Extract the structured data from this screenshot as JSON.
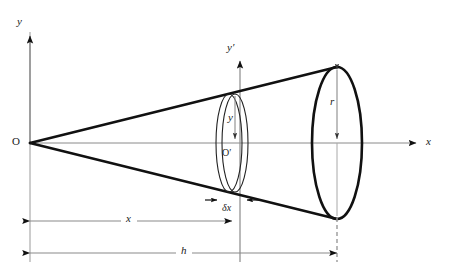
{
  "figure": {
    "background_color": "#ffffff",
    "stroke_color": "#111111",
    "axis_color": "#808080",
    "thin_color": "#222222",
    "dash_color": "#9a9a9a",
    "width": 454,
    "height": 277
  },
  "labels": {
    "y_axis": "y",
    "y_prime_axis": "y′",
    "x_axis": "x",
    "origin": "O",
    "origin_prime": "O′",
    "radius_small": "y",
    "radius_large": "r",
    "thickness": "δx",
    "distance_x": "x",
    "height_h": "h"
  },
  "geometry": {
    "origin": {
      "x": 30,
      "y": 143
    },
    "x_axis_end": {
      "x": 420,
      "y": 143
    },
    "y_axis_top": {
      "x": 30,
      "y": 32
    },
    "y_prime_axis": {
      "x": 240,
      "top": 57,
      "bottom": 262
    },
    "small_ellipse_front": {
      "cx": 235,
      "cy": 143,
      "rx": 13,
      "ry": 49
    },
    "small_ellipse_back": {
      "cx": 229,
      "cy": 143,
      "rx": 13,
      "ry": 49
    },
    "large_ellipse": {
      "cx": 337,
      "cy": 143,
      "rx": 25,
      "ry": 76
    },
    "cone_upper_line": {
      "x1": 30,
      "y1": 143,
      "x2": 337,
      "y2": 67
    },
    "cone_lower_line": {
      "x1": 30,
      "y1": 143,
      "x2": 337,
      "y2": 219
    },
    "dimension_x": {
      "y": 221,
      "x1": 30,
      "x2": 232
    },
    "dimension_h": {
      "y": 253,
      "x1": 30,
      "x2": 337
    },
    "dimension_dx": {
      "y": 200,
      "x1": 216,
      "x2": 248
    },
    "dashed_vertical": {
      "x": 337,
      "y1": 218,
      "y2": 262
    },
    "reference_vertical": {
      "x": 30,
      "y1": 32,
      "y2": 262
    }
  },
  "chart_data": {
    "type": "diagram",
    "elements": [
      {
        "name": "apex",
        "label": "O",
        "x": 30,
        "y": 143
      },
      {
        "name": "disc-centre",
        "label": "O′",
        "x": 235,
        "y": 143
      },
      {
        "name": "disc-radius",
        "label": "y"
      },
      {
        "name": "base-radius",
        "label": "r"
      },
      {
        "name": "disc-thickness",
        "label": "δx"
      },
      {
        "name": "apex-to-disc",
        "label": "x"
      },
      {
        "name": "cone-height",
        "label": "h"
      }
    ]
  }
}
